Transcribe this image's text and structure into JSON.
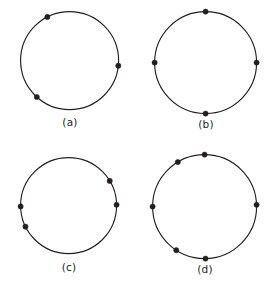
{
  "figure": {
    "type": "diagram",
    "width": 271,
    "height": 288,
    "background_color": "#ffffff",
    "stroke_color": "#231f20",
    "dot_color": "#231f20",
    "dot_radius": 2.6,
    "circle_stroke_width": 1.15
  },
  "panels": [
    {
      "id": "a",
      "label": "(a)",
      "center": {
        "x": 70,
        "y": 61
      },
      "radius": 49,
      "label_x": 70,
      "label_y": 116,
      "point_count": 3,
      "points": [
        {
          "name": "point-1",
          "angle_deg": 117
        },
        {
          "name": "point-2",
          "angle_deg": 354
        },
        {
          "name": "point-3",
          "angle_deg": 228
        }
      ]
    },
    {
      "id": "b",
      "label": "(b)",
      "center": {
        "x": 206,
        "y": 63
      },
      "radius": 51,
      "label_x": 206,
      "label_y": 118,
      "point_count": 4,
      "points": [
        {
          "name": "point-1",
          "angle_deg": 90
        },
        {
          "name": "point-2",
          "angle_deg": 0
        },
        {
          "name": "point-3",
          "angle_deg": 270
        },
        {
          "name": "point-4",
          "angle_deg": 180
        }
      ]
    },
    {
      "id": "c",
      "label": "(c)",
      "center": {
        "x": 69,
        "y": 206
      },
      "radius": 48,
      "label_x": 69,
      "label_y": 261,
      "point_count": 4,
      "points": [
        {
          "name": "point-1",
          "angle_deg": 31
        },
        {
          "name": "point-2",
          "angle_deg": 1
        },
        {
          "name": "point-3",
          "angle_deg": 181
        },
        {
          "name": "point-4",
          "angle_deg": 206
        }
      ]
    },
    {
      "id": "d",
      "label": "(d)",
      "center": {
        "x": 205,
        "y": 207
      },
      "radius": 52,
      "label_x": 205,
      "label_y": 263,
      "point_count": 6,
      "points": [
        {
          "name": "point-1",
          "angle_deg": 90
        },
        {
          "name": "point-2",
          "angle_deg": 121
        },
        {
          "name": "point-3",
          "angle_deg": 180
        },
        {
          "name": "point-4",
          "angle_deg": 237
        },
        {
          "name": "point-5",
          "angle_deg": 271
        },
        {
          "name": "point-6",
          "angle_deg": 2
        }
      ]
    }
  ]
}
